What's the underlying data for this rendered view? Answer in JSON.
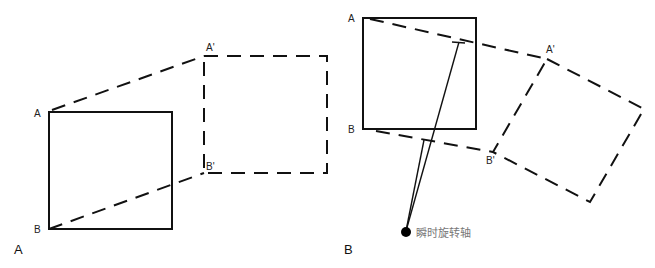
{
  "panels": [
    {
      "id": "A",
      "panel_label": "A",
      "points": {
        "a": "A",
        "b": "B",
        "a_prime": "A'",
        "b_prime": "B'"
      },
      "description": "Pure translation: square AB moves to dashed square A'B'"
    },
    {
      "id": "B",
      "panel_label": "B",
      "points": {
        "a": "A",
        "b": "B",
        "a_prime": "A'",
        "b_prime": "B'"
      },
      "axis_label": "瞬时旋转轴",
      "description": "Rotation about an instantaneous axis of rotation"
    }
  ],
  "colors": {
    "line": "#111111",
    "axis_label": "#777777",
    "background": "#ffffff"
  }
}
